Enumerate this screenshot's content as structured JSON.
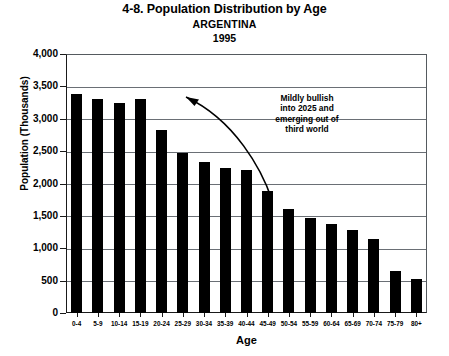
{
  "chart_data": {
    "type": "bar",
    "title": "4-8. Population Distribution by Age",
    "subtitle": "ARGENTINA",
    "year": "1995",
    "xlabel": "Age",
    "ylabel": "Population (Thousands)",
    "ylim": [
      0,
      4000
    ],
    "ytick_step": 500,
    "grid": true,
    "legend": "none",
    "bar_color": "#000000",
    "categories": [
      "0-4",
      "5-9",
      "10-14",
      "15-19",
      "20-24",
      "25-29",
      "30-34",
      "35-39",
      "40-44",
      "45-49",
      "50-54",
      "55-59",
      "60-64",
      "65-69",
      "70-74",
      "75-79",
      "80+"
    ],
    "values": [
      3390,
      3310,
      3240,
      3300,
      2820,
      2470,
      2330,
      2240,
      2210,
      1880,
      1600,
      1460,
      1370,
      1280,
      1150,
      650,
      530
    ],
    "ytick_labels": [
      "4,000",
      "3,500",
      "3,000",
      "2,500",
      "2,000",
      "1,500",
      "1,000",
      "500",
      "0"
    ],
    "annotations": [
      {
        "text": "Mildly bullish into 2025 and emerging out of third world",
        "lines": [
          "Mildly bullish",
          "into 2025 and",
          "emerging out of",
          "third world"
        ],
        "arrow": "curved arrow from lower-right sweeping up-left toward the 15-19 age bar"
      }
    ]
  }
}
